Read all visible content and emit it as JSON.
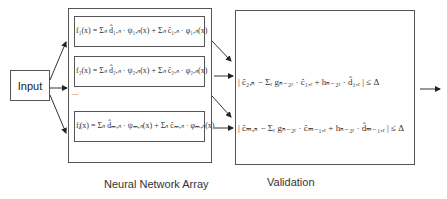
{
  "input": {
    "label": "Input"
  },
  "nn_array": {
    "caption": "Neural Network Array",
    "formulas": [
      "f₁(x) = Σₙ d̂₁,ₙ · ψ₁,ₙ(x) + Σₙ ĉ₁,ₙ · φ₁,ₙ(x)",
      "f₂(x) = Σₙ d̂₂,ₙ · ψ₂,ₙ(x) + Σₙ ĉ₂,ₙ · φ₂,ₙ(x)",
      "fⱼ(x) = Σₙ d̂ₘ,ₙ · ψₘ,ₙ(x) + Σₙ ĉₘ,ₙ · φₘ,ₙ(x)"
    ],
    "ellipsis": "..."
  },
  "validation": {
    "caption": "Validation",
    "conditions": [
      "| ĉ₂,ₙ − Σᵣ gₙ₋₂ᵣ · ĉ₁,ᵣ + hₙ₋₂ᵣ · d̂₁,ᵣ | ≤ Δ",
      "| ĉₘ,ₙ − Σᵣ gₙ₋₂ᵣ · ĉₘ₋₁,ᵣ + hₙ₋₂ᵣ · d̂ₘ₋₁,ᵣ | ≤ Δ"
    ]
  }
}
